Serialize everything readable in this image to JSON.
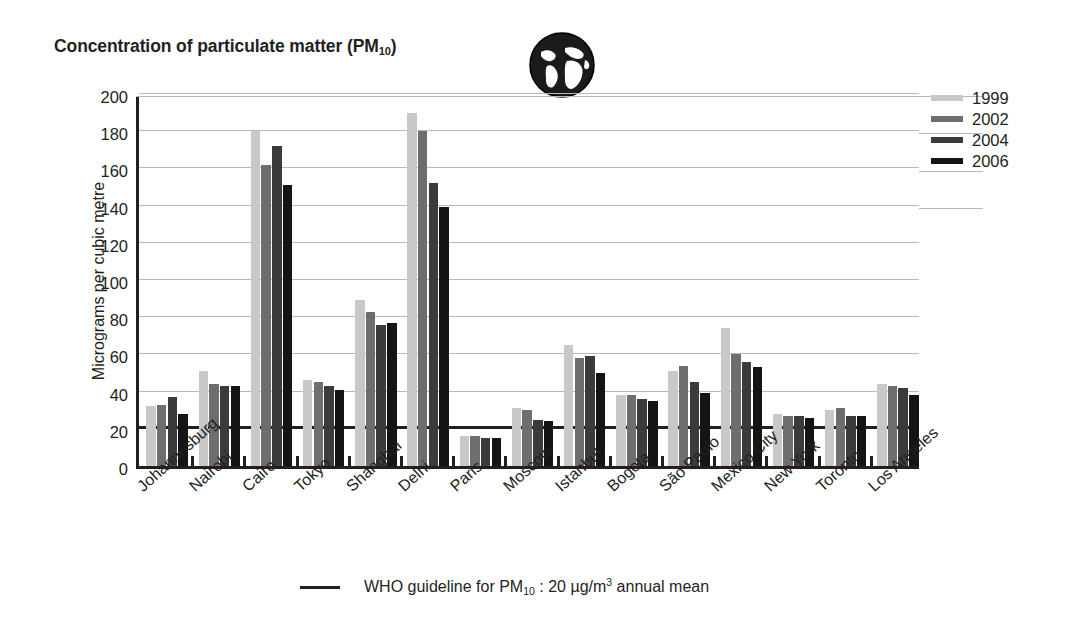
{
  "header": {
    "title_main": "Concentration of particulate matter (PM",
    "title_sub": "10",
    "title_tail": ")",
    "globe_icon": "globe-icon"
  },
  "legend": {
    "position": "right",
    "entries": [
      {
        "label": "1999",
        "color": "#c9c8c6"
      },
      {
        "label": "2002",
        "color": "#6f6e6f"
      },
      {
        "label": "2004",
        "color": "#3c3b3c"
      },
      {
        "label": "2006",
        "color": "#141414"
      }
    ]
  },
  "footnote": {
    "prefix": "WHO guideline for PM",
    "sub": "10",
    "mid": " : 20 µg/m",
    "sup": "3",
    "tail": " annual mean",
    "line_color": "#231f20",
    "value": 20
  },
  "chart_data": {
    "type": "bar",
    "title": "Concentration of particulate matter (PM10)",
    "xlabel": "",
    "ylabel": "Micrograms per cubic metre",
    "ylim": [
      0,
      200
    ],
    "yticks": [
      0,
      20,
      40,
      60,
      80,
      100,
      120,
      140,
      160,
      180,
      200
    ],
    "ytick_labels": [
      "0",
      "20",
      "40",
      "60",
      "80",
      "100",
      "120",
      "140",
      "160",
      "180",
      "200"
    ],
    "grid": true,
    "legend_position": "right",
    "categories": [
      "Johannesburg",
      "Nairobi",
      "Cairo",
      "Tokyo",
      "Shanghai",
      "Delhi",
      "Paris",
      "Moscow",
      "Istanbul",
      "Bogota",
      "São Paolo",
      "Mexico City",
      "New York",
      "Toronto",
      "Los Angeles"
    ],
    "series": [
      {
        "name": "1999",
        "color": "#c9c8c6",
        "values": [
          32,
          51,
          180,
          46,
          89,
          190,
          16,
          31,
          65,
          38,
          51,
          74,
          28,
          30,
          44
        ]
      },
      {
        "name": "2002",
        "color": "#6f6e6f",
        "values": [
          33,
          44,
          162,
          45,
          83,
          180,
          16,
          30,
          58,
          38,
          54,
          60,
          27,
          31,
          43
        ]
      },
      {
        "name": "2004",
        "color": "#3c3b3c",
        "values": [
          37,
          43,
          172,
          43,
          76,
          152,
          15,
          25,
          59,
          36,
          45,
          56,
          27,
          27,
          42
        ]
      },
      {
        "name": "2006",
        "color": "#141414",
        "values": [
          28,
          43,
          151,
          41,
          77,
          139,
          15,
          24,
          50,
          35,
          39,
          53,
          26,
          27,
          38
        ]
      }
    ],
    "reference_line": {
      "label": "WHO guideline for PM10 : 20 µg/m3 annual mean",
      "value": 20
    }
  }
}
